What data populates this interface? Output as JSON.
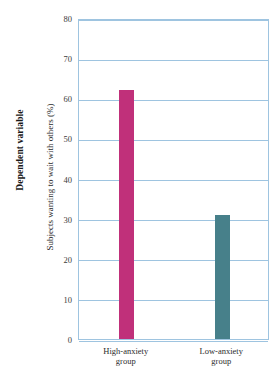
{
  "chart_data": {
    "type": "bar",
    "title": "",
    "subtitle": "",
    "outer_axis_caption": "Dependent variable",
    "xlabel": "",
    "ylabel": "Subjects wanting to wait with others (%)",
    "categories": [
      "High-anxiety group",
      "Low-anxiety group"
    ],
    "category_lines": [
      [
        "High-anxiety",
        "group"
      ],
      [
        "Low-anxiety",
        "group"
      ]
    ],
    "values": [
      62,
      31
    ],
    "ylim": [
      0,
      80
    ],
    "ytick_step": 10,
    "yticks": [
      "0",
      "10",
      "20",
      "30",
      "40",
      "50",
      "60",
      "70",
      "80"
    ],
    "grid": true,
    "legend": "none",
    "bar_colors": [
      "#c0307a",
      "#47808a"
    ],
    "grid_color": "#9ec4e0",
    "frame_color": "#9ec4e0",
    "background": "#ffffff"
  }
}
